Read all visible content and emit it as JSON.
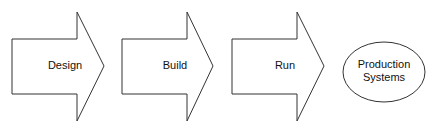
{
  "diagram": {
    "steps": [
      {
        "label": "Design"
      },
      {
        "label": "Build"
      },
      {
        "label": "Run"
      }
    ],
    "target": {
      "line1": "Production",
      "line2": "Systems"
    },
    "colors": {
      "stroke": "#333333",
      "fill": "#ffffff",
      "text": "#111111"
    }
  }
}
